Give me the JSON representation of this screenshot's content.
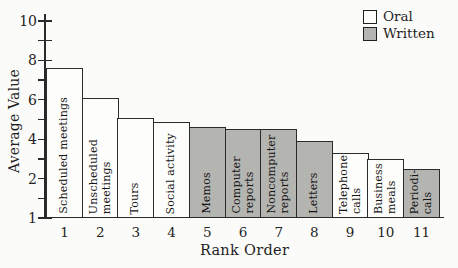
{
  "colors": {
    "background": "#fbfbf9",
    "ink": "#1f1f1f",
    "oral_fill": "#fdfdfc",
    "written_fill": "#b4b4b1"
  },
  "chart_data": {
    "type": "bar",
    "title": "",
    "xlabel": "Rank Order",
    "ylabel": "Average Value",
    "ylim": [
      1,
      10
    ],
    "grid": false,
    "legend_position": "top-right",
    "y_tick_labels": [
      "10",
      "",
      "8",
      "",
      "6",
      "",
      "4",
      "",
      "2",
      "",
      "1"
    ],
    "x_tick_labels": [
      "1",
      "2",
      "3",
      "4",
      "5",
      "6",
      "7",
      "8",
      "9",
      "10",
      "11"
    ],
    "categories": [
      "Scheduled meetings",
      "Unscheduled meetings",
      "Tours",
      "Social activity",
      "Memos",
      "Computer reports",
      "Noncomputer reports",
      "Letters",
      "Telephone calls",
      "Business meals",
      "Periodicals"
    ],
    "bar_label_lines": [
      [
        "Scheduled meetings"
      ],
      [
        "Unscheduled",
        "meetings"
      ],
      [
        "Tours"
      ],
      [
        "Social activity"
      ],
      [
        "Memos"
      ],
      [
        "Computer",
        "reports"
      ],
      [
        "Noncomputer",
        "reports"
      ],
      [
        "Letters"
      ],
      [
        "Telephone",
        "calls"
      ],
      [
        "Business",
        "meals"
      ],
      [
        "Periodi-",
        "cals"
      ]
    ],
    "values": [
      7.6,
      6.1,
      5.1,
      4.9,
      4.6,
      4.5,
      4.5,
      3.9,
      3.3,
      3.0,
      2.5
    ],
    "series_membership": [
      "Oral",
      "Oral",
      "Oral",
      "Oral",
      "Written",
      "Written",
      "Written",
      "Written",
      "Oral",
      "Oral",
      "Written"
    ],
    "legend": [
      {
        "label": "Oral",
        "fill": "#fdfdfc"
      },
      {
        "label": "Written",
        "fill": "#b4b4b1"
      }
    ]
  }
}
